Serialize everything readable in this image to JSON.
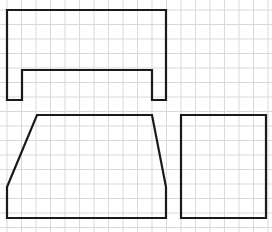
{
  "diagram": {
    "type": "grid-shapes",
    "grid": {
      "spacing": 14.5,
      "origin_x": 7,
      "origin_y": 10,
      "color": "#d9d9d9"
    },
    "stroke_color": "#1a1a1a",
    "shapes": [
      {
        "name": "top-bracket-shape",
        "points": "7,10 166,10 166,100 152,100 152,70 22,70 22,100 7,100"
      },
      {
        "name": "trapezoid-shape",
        "points": "37,115 152,115 166,187 166,218 7,218 7,187"
      },
      {
        "name": "square-shape",
        "points": "181,115 266,115 266,218 181,218"
      }
    ]
  }
}
